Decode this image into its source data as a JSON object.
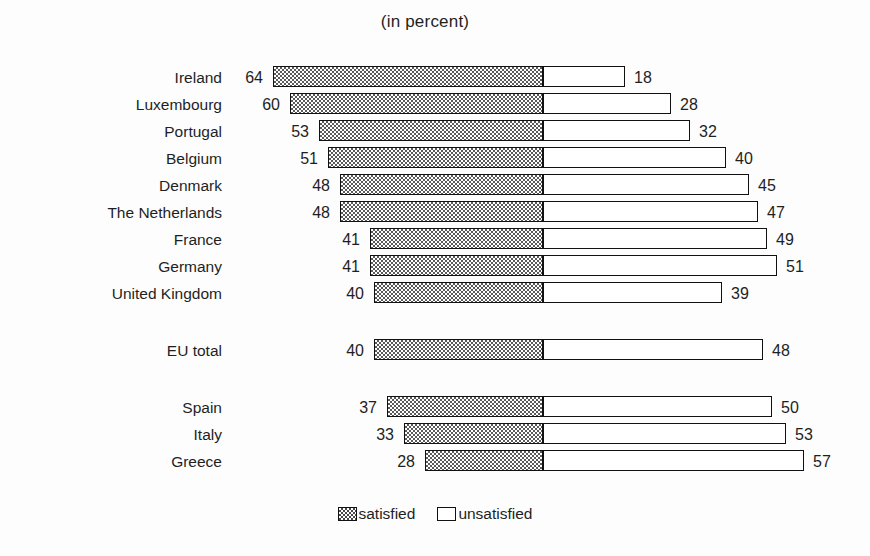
{
  "chart": {
    "title": "(in percent)"
  },
  "legend": {
    "position": "bottom-center",
    "entries": [
      {
        "key": "satisfied",
        "label": "satisfied",
        "swatch": "hatched-checkerboard",
        "color": "#5a5a5a"
      },
      {
        "key": "unsatisfied",
        "label": "unsatisfied",
        "swatch": "white-outline",
        "color": "#ffffff"
      }
    ]
  },
  "chart_data": {
    "type": "bar",
    "subtype": "diverging-stacked-horizontal",
    "title": "(in percent)",
    "xlabel": "",
    "ylabel": "",
    "grid": false,
    "legend_position": "bottom-center",
    "axis_origin_note": "bars diverge from a common vertical split: satisfied extends left, unsatisfied extends right",
    "categories": [
      "Ireland",
      "Luxembourg",
      "Portugal",
      "Belgium",
      "Denmark",
      "The Netherlands",
      "France",
      "Germany",
      "United Kingdom",
      "EU total",
      "Spain",
      "Italy",
      "Greece"
    ],
    "series": [
      {
        "name": "satisfied",
        "direction": "left",
        "values": [
          64,
          60,
          53,
          51,
          48,
          48,
          41,
          41,
          40,
          40,
          37,
          33,
          28
        ]
      },
      {
        "name": "unsatisfied",
        "direction": "right",
        "values": [
          18,
          28,
          32,
          40,
          45,
          47,
          49,
          51,
          39,
          48,
          50,
          53,
          57
        ]
      }
    ],
    "rows": [
      {
        "category": "Ireland",
        "satisfied": 64,
        "unsatisfied": 18,
        "group": "countries"
      },
      {
        "category": "Luxembourg",
        "satisfied": 60,
        "unsatisfied": 28,
        "group": "countries"
      },
      {
        "category": "Portugal",
        "satisfied": 53,
        "unsatisfied": 32,
        "group": "countries"
      },
      {
        "category": "Belgium",
        "satisfied": 51,
        "unsatisfied": 40,
        "group": "countries"
      },
      {
        "category": "Denmark",
        "satisfied": 48,
        "unsatisfied": 45,
        "group": "countries"
      },
      {
        "category": "The Netherlands",
        "satisfied": 48,
        "unsatisfied": 47,
        "group": "countries"
      },
      {
        "category": "France",
        "satisfied": 41,
        "unsatisfied": 49,
        "group": "countries"
      },
      {
        "category": "Germany",
        "satisfied": 41,
        "unsatisfied": 51,
        "group": "countries"
      },
      {
        "category": "United Kingdom",
        "satisfied": 40,
        "unsatisfied": 39,
        "group": "countries"
      },
      {
        "category": "EU total",
        "satisfied": 40,
        "unsatisfied": 48,
        "group": "total"
      },
      {
        "category": "Spain",
        "satisfied": 37,
        "unsatisfied": 50,
        "group": "countries"
      },
      {
        "category": "Italy",
        "satisfied": 33,
        "unsatisfied": 53,
        "group": "countries"
      },
      {
        "category": "Greece",
        "satisfied": 28,
        "unsatisfied": 57,
        "group": "countries"
      }
    ],
    "xlim": [
      -70,
      65
    ],
    "value_labels": {
      "left": [
        64,
        60,
        53,
        51,
        48,
        48,
        41,
        41,
        40,
        40,
        37,
        33,
        28
      ],
      "right": [
        18,
        28,
        32,
        40,
        45,
        47,
        49,
        51,
        39,
        48,
        50,
        53,
        57
      ]
    }
  },
  "layout": {
    "split_x": 543,
    "left_px_per_unit": 4.22,
    "right_px_per_unit": 4.58,
    "row_height": 27,
    "bar_height": 21,
    "first_row_top": 8,
    "group_gap": 30
  }
}
